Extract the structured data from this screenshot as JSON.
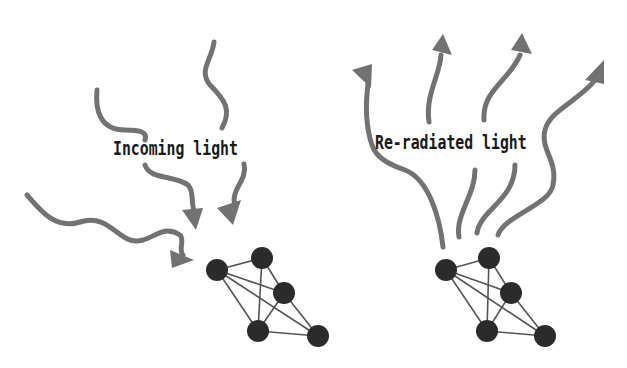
{
  "panels": {
    "left": {
      "label": "Incoming light",
      "arrow_direction": "inward",
      "arrow_count": 4
    },
    "right": {
      "label": "Re-radiated light",
      "arrow_direction": "outward",
      "arrow_count": 4
    }
  },
  "colors": {
    "arrow": "#727272",
    "node": "#2b2b2b",
    "edge": "#555555",
    "text": "#1a1a1a",
    "background": "#ffffff"
  },
  "molecule": {
    "node_count": 5,
    "description": "network of 5 atoms connected by lines"
  }
}
